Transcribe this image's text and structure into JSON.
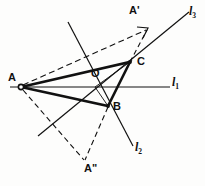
{
  "figure": {
    "kind": "geometry-diagram",
    "background_color": "#fdfdfc",
    "stroke_color": "#111111",
    "width": 205,
    "height": 186
  },
  "points": {
    "A": {
      "label": "A",
      "x": 21,
      "y": 87,
      "label_x": 9,
      "label_y": 74,
      "marked": true
    },
    "B": {
      "label": "B",
      "x": 108,
      "y": 106,
      "label_x": 114,
      "label_y": 103,
      "marked": true
    },
    "C": {
      "label": "C",
      "x": 130,
      "y": 62,
      "label_x": 137,
      "label_y": 58,
      "marked": true
    },
    "O": {
      "label": "O",
      "x": 95,
      "y": 87,
      "label_x": 91,
      "label_y": 69,
      "marked": false
    },
    "A1": {
      "label": "A'",
      "x": 148,
      "y": 28,
      "label_x": 130,
      "label_y": 7,
      "marked": false
    },
    "A2": {
      "label": "A\"",
      "x": 84,
      "y": 160,
      "label_x": 85,
      "label_y": 164,
      "marked": false
    }
  },
  "lines": {
    "l1": {
      "label": "l",
      "sub": "1",
      "x1": 10,
      "y1": 87,
      "x2": 170,
      "y2": 87,
      "label_x": 172,
      "label_y": 78,
      "style": "solid",
      "weight": "thin"
    },
    "l2": {
      "label": "l",
      "sub": "2",
      "x1": 68,
      "y1": 22,
      "x2": 133,
      "y2": 146,
      "label_x": 136,
      "label_y": 142,
      "style": "solid",
      "weight": "thin"
    },
    "l3": {
      "label": "l",
      "sub": "3",
      "x1": 38,
      "y1": 136,
      "x2": 189,
      "y2": 12,
      "label_x": 190,
      "label_y": 6,
      "style": "solid",
      "weight": "thin"
    }
  },
  "triangle": {
    "name": "triangle-ABC",
    "vertices": [
      "A",
      "B",
      "C"
    ],
    "style": "solid",
    "weight": "thick"
  },
  "dashed_constructions": [
    {
      "name": "dashed-A-to-A-prime",
      "from": "A",
      "to": "A1",
      "arrow": true
    },
    {
      "name": "dashed-C-to-A-prime",
      "from": "C",
      "to": "A1",
      "arrow": false
    },
    {
      "name": "dashed-A-to-A-double-prime",
      "from": "A",
      "to": "A2",
      "arrow": false
    },
    {
      "name": "dashed-B-to-A-double-prime",
      "from": "B",
      "to": "A2",
      "arrow": false
    }
  ],
  "inner_segments": [
    {
      "name": "segment-A-to-C-inner",
      "from": "A",
      "to": "C"
    },
    {
      "name": "segment-A-to-B-inner",
      "from": "A",
      "to": "B"
    },
    {
      "name": "segment-O-to-C",
      "from": "O",
      "to": "C"
    },
    {
      "name": "segment-O-to-B",
      "from": "O",
      "to": "B"
    }
  ],
  "labels": {
    "point_A": "A",
    "point_B": "B",
    "point_C": "C",
    "point_O": "O",
    "point_A_prime": "A'",
    "point_A_double_prime": "A\"",
    "line_l1_base": "l",
    "line_l1_sub": "1",
    "line_l2_base": "l",
    "line_l2_sub": "2",
    "line_l3_base": "l",
    "line_l3_sub": "3"
  }
}
